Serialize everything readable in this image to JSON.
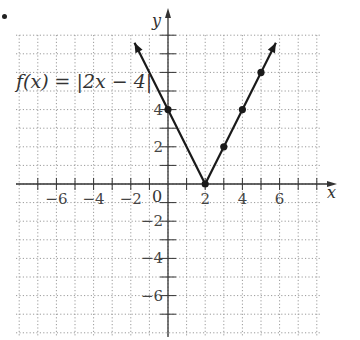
{
  "chart_data": {
    "type": "line",
    "title": "",
    "function_label": "f(x) = |2x − 4|",
    "xlabel": "x",
    "ylabel": "y",
    "xlim": [
      -8,
      8
    ],
    "ylim": [
      -8,
      8
    ],
    "grid": true,
    "x_tick_labels": [
      "−6",
      "−4",
      "−2",
      "2",
      "4",
      "6"
    ],
    "x_tick_values": [
      -6,
      -4,
      -2,
      2,
      4,
      6
    ],
    "y_tick_labels": [
      "4",
      "2",
      "−2",
      "−4",
      "−6"
    ],
    "y_tick_values": [
      4,
      2,
      -2,
      -4,
      -6
    ],
    "origin_label": "0",
    "series": [
      {
        "name": "f(x) = |2x − 4|",
        "x": [
          -1,
          0,
          2,
          3,
          4,
          5,
          6
        ],
        "y": [
          6,
          4,
          0,
          2,
          4,
          6,
          8
        ],
        "style": "line with arrows at both ends"
      }
    ],
    "marked_points": [
      {
        "x": 0,
        "y": 4
      },
      {
        "x": 2,
        "y": 0
      },
      {
        "x": 3,
        "y": 2
      },
      {
        "x": 4,
        "y": 4
      },
      {
        "x": 5,
        "y": 6
      }
    ],
    "colors": {
      "line": "#1a1a1a",
      "grid": "#9a9a9a",
      "axis": "#333333"
    }
  }
}
